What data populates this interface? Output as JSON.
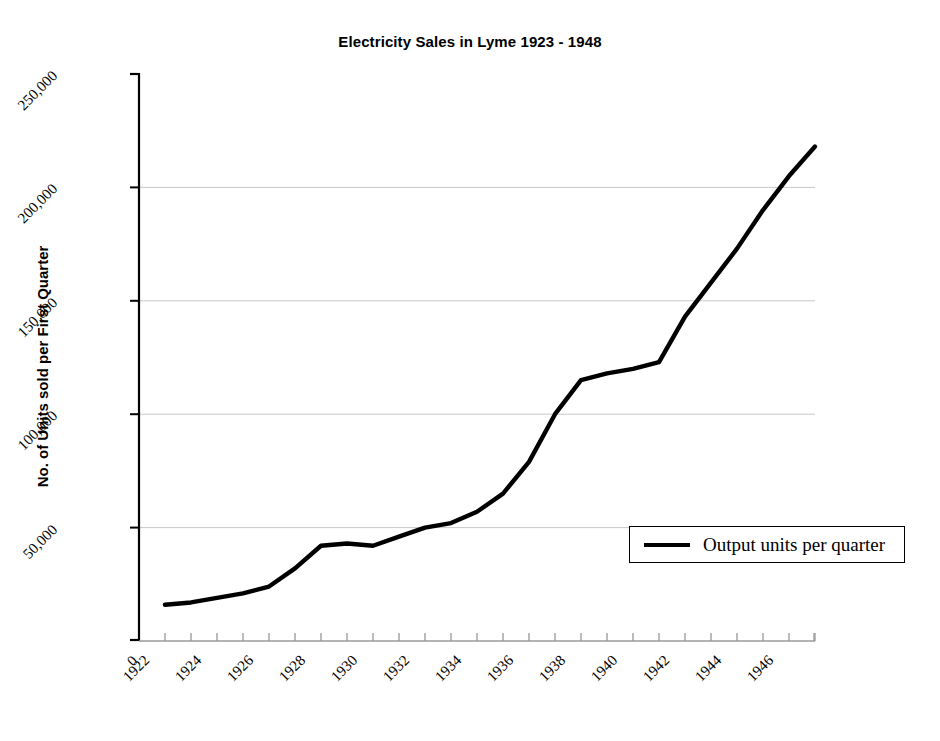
{
  "chart_data": {
    "type": "line",
    "title": "Electricity Sales in Lyme 1923 - 1948",
    "xlabel": "",
    "ylabel": "No. of Units sold per First Quarter",
    "xlim": [
      1922,
      1948
    ],
    "ylim": [
      0,
      250000
    ],
    "grid": "horizontal",
    "legend_position": "inside-lower-right",
    "y_ticks": [
      {
        "value": 50000,
        "label": "50,000"
      },
      {
        "value": 100000,
        "label": "100,000"
      },
      {
        "value": 150000,
        "label": "150,000"
      },
      {
        "value": 200000,
        "label": "200,000"
      },
      {
        "value": 250000,
        "label": "250,000"
      }
    ],
    "x_ticks": [
      {
        "value": 1922,
        "label": "1922"
      },
      {
        "value": 1924,
        "label": "1924"
      },
      {
        "value": 1926,
        "label": "1926"
      },
      {
        "value": 1928,
        "label": "1928"
      },
      {
        "value": 1930,
        "label": "1930"
      },
      {
        "value": 1932,
        "label": "1932"
      },
      {
        "value": 1934,
        "label": "1934"
      },
      {
        "value": 1936,
        "label": "1936"
      },
      {
        "value": 1938,
        "label": "1938"
      },
      {
        "value": 1940,
        "label": "1940"
      },
      {
        "value": 1942,
        "label": "1942"
      },
      {
        "value": 1944,
        "label": "1944"
      },
      {
        "value": 1946,
        "label": "1946"
      }
    ],
    "x_minor_tick_interval": 1,
    "origin_label": "0",
    "series": [
      {
        "name": "Output units per quarter",
        "color": "#000000",
        "line_width": 4.4,
        "x": [
          1923,
          1924,
          1925,
          1926,
          1927,
          1928,
          1929,
          1930,
          1931,
          1932,
          1933,
          1934,
          1935,
          1936,
          1937,
          1938,
          1939,
          1940,
          1941,
          1942,
          1943,
          1944,
          1945,
          1946,
          1947,
          1948
        ],
        "values": [
          16000,
          17000,
          19000,
          21000,
          24000,
          32000,
          42000,
          43000,
          42000,
          46000,
          50000,
          52000,
          57000,
          65000,
          79000,
          100000,
          115000,
          118000,
          120000,
          123000,
          143000,
          158000,
          173000,
          190000,
          205000,
          218000
        ]
      }
    ]
  },
  "legend": {
    "entries": [
      {
        "label": "Output units per quarter",
        "swatch": "line-swatch"
      }
    ]
  }
}
